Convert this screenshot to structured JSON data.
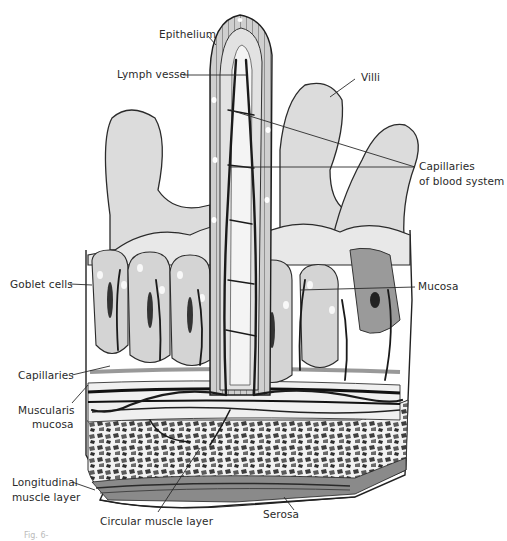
{
  "figure": {
    "caption_fragment": "Fig. 6-",
    "colors": {
      "ink": "#2a2a2a",
      "tissue_light": "#e6e6e6",
      "tissue_mid": "#c8c8c8",
      "tissue_dark": "#6b6b6b",
      "vessel": "#1a1a1a",
      "background": "#ffffff"
    }
  },
  "labels": {
    "epithelium": "Epithelium",
    "lymph_vessel": "Lymph vessel",
    "villi": "Villi",
    "capillaries_blood_line1": "Capillaries",
    "capillaries_blood_line2": "of blood system",
    "goblet_cells": "Goblet cells",
    "mucosa": "Mucosa",
    "capillaries": "Capillaries",
    "muscularis_line1": "Muscularis",
    "muscularis_line2": "mucosa",
    "longitudinal_line1": "Longitudinal",
    "longitudinal_line2": "muscle layer",
    "circular_muscle": "Circular muscle layer",
    "serosa": "Serosa"
  }
}
